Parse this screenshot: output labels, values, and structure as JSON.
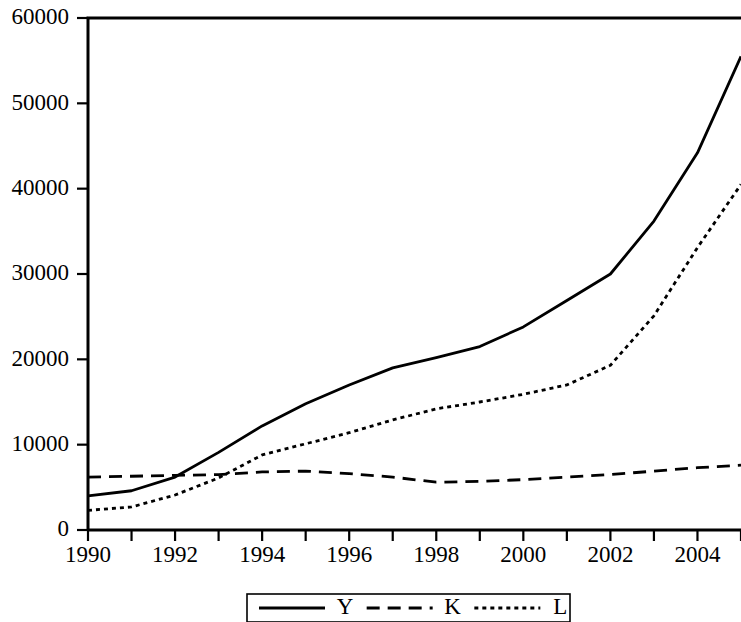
{
  "chart_data": {
    "type": "line",
    "title": "",
    "subtitle": "",
    "xlabel": "",
    "ylabel": "",
    "x": [
      1990,
      1991,
      1992,
      1993,
      1994,
      1995,
      1996,
      1997,
      1998,
      1999,
      2000,
      2001,
      2002,
      2003,
      2004,
      2005
    ],
    "categories": [
      "1990",
      "1991",
      "1992",
      "1993",
      "1994",
      "1995",
      "1996",
      "1997",
      "1998",
      "1999",
      "2000",
      "2001",
      "2002",
      "2003",
      "2004",
      "2005"
    ],
    "xlim": [
      1990,
      2005
    ],
    "ylim": [
      0,
      60000
    ],
    "xticks": [
      1990,
      1991,
      1992,
      1993,
      1994,
      1995,
      1996,
      1997,
      1998,
      1999,
      2000,
      2001,
      2002,
      2003,
      2004,
      2005
    ],
    "xticklabels": [
      "1990",
      "",
      "1992",
      "",
      "1994",
      "",
      "1996",
      "",
      "1998",
      "",
      "2000",
      "",
      "2002",
      "",
      "2004",
      ""
    ],
    "xticklabels_major": [
      "1990",
      "1992",
      "1994",
      "1996",
      "1998",
      "2000",
      "2002",
      "2004"
    ],
    "yticks": [
      0,
      10000,
      20000,
      30000,
      40000,
      50000,
      60000
    ],
    "yticklabels": [
      "0",
      "10000",
      "20000",
      "30000",
      "40000",
      "50000",
      "60000"
    ],
    "grid": false,
    "legend_position": "bottom-outside",
    "series": [
      {
        "name": "Y",
        "style": "solid",
        "color": "#000000",
        "values": [
          4000,
          4600,
          6200,
          9100,
          12200,
          14800,
          17000,
          19000,
          20200,
          21500,
          23800,
          26900,
          30000,
          36200,
          44200,
          55500
        ]
      },
      {
        "name": "K",
        "style": "dashed",
        "color": "#000000",
        "values": [
          6200,
          6300,
          6400,
          6500,
          6800,
          6900,
          6600,
          6200,
          5600,
          5700,
          5900,
          6200,
          6500,
          6900,
          7300,
          7600
        ]
      },
      {
        "name": "L",
        "style": "dotted",
        "color": "#000000",
        "values": [
          2300,
          2700,
          4100,
          6100,
          8800,
          10100,
          11400,
          12900,
          14200,
          15000,
          15900,
          17000,
          19300,
          25100,
          33100,
          40500
        ]
      }
    ]
  },
  "legend": {
    "entries": [
      {
        "label": "Y",
        "style": "solid"
      },
      {
        "label": "K",
        "style": "dashed"
      },
      {
        "label": "L",
        "style": "dotted"
      }
    ]
  },
  "axes": {
    "y_tick_labels": [
      "60000",
      "50000",
      "40000",
      "30000",
      "20000",
      "10000",
      "0"
    ],
    "x_tick_labels": [
      "1990",
      "1992",
      "1994",
      "1996",
      "1998",
      "2000",
      "2002",
      "2004"
    ]
  }
}
